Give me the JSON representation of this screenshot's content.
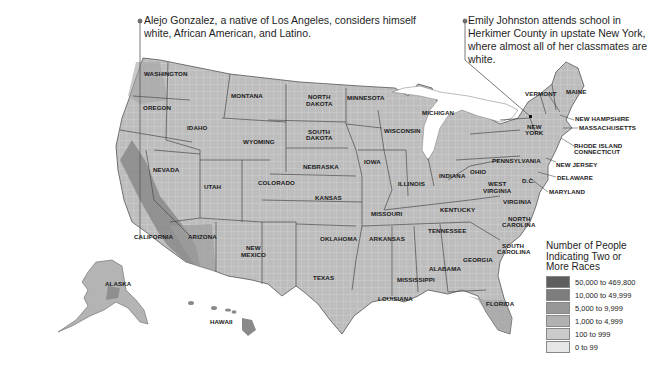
{
  "callouts": {
    "left": "Alejo Gonzalez, a native of Los Angeles, considers himself white, African American, and Latino.",
    "right": "Emily Johnston attends school in Herkimer County in upstate New York, where almost all of her classmates are white."
  },
  "legend": {
    "title": "Number of People Indicating Two or More Races",
    "items": [
      {
        "label": "50,000 to 469,800",
        "color": "#5e5e5e"
      },
      {
        "label": "10,000 to 49,999",
        "color": "#7d7d7d"
      },
      {
        "label": "5,000 to 9,999",
        "color": "#979797"
      },
      {
        "label": "1,000 to 4,999",
        "color": "#b1b1b1"
      },
      {
        "label": "100 to 999",
        "color": "#cbcbcb"
      },
      {
        "label": "0 to 99",
        "color": "#e6e6e6"
      }
    ]
  },
  "states": {
    "washington": "WASHINGTON",
    "oregon": "OREGON",
    "california": "CALIFORNIA",
    "nevada": "NEVADA",
    "idaho": "IDAHO",
    "montana": "MONTANA",
    "wyoming": "WYOMING",
    "utah": "UTAH",
    "colorado": "COLORADO",
    "arizona": "ARIZONA",
    "new_mexico_1": "NEW",
    "new_mexico_2": "MEXICO",
    "north_dakota_1": "NORTH",
    "north_dakota_2": "DAKOTA",
    "south_dakota_1": "SOUTH",
    "south_dakota_2": "DAKOTA",
    "nebraska": "NEBRASKA",
    "kansas": "KANSAS",
    "oklahoma": "OKLAHOMA",
    "texas": "TEXAS",
    "minnesota": "MINNESOTA",
    "iowa": "IOWA",
    "missouri": "MISSOURI",
    "arkansas": "ARKANSAS",
    "louisiana": "LOUISIANA",
    "wisconsin": "WISCONSIN",
    "illinois": "ILLINOIS",
    "michigan": "MICHIGAN",
    "indiana": "INDIANA",
    "ohio": "OHIO",
    "kentucky": "KENTUCKY",
    "tennessee": "TENNESSEE",
    "mississippi": "MISSISSIPPI",
    "alabama": "ALABAMA",
    "georgia": "GEORGIA",
    "florida": "FLORIDA",
    "south_carolina_1": "SOUTH",
    "south_carolina_2": "CAROLINA",
    "north_carolina_1": "NORTH",
    "north_carolina_2": "CAROLINA",
    "virginia": "VIRGINIA",
    "west_virginia_1": "WEST",
    "west_virginia_2": "VIRGINIA",
    "pennsylvania": "PENNSYLVANIA",
    "new_york_1": "NEW",
    "new_york_2": "YORK",
    "vermont": "VERMONT",
    "maine": "MAINE",
    "new_hampshire": "NEW HAMPSHIRE",
    "massachusetts": "MASSACHUSETTS",
    "rhode_island": "RHODE ISLAND",
    "connecticut": "CONNECTICUT",
    "new_jersey": "NEW JERSEY",
    "delaware": "DELAWARE",
    "maryland": "MARYLAND",
    "dc": "D.C.",
    "alaska": "ALASKA",
    "hawaii": "HAWAII"
  }
}
